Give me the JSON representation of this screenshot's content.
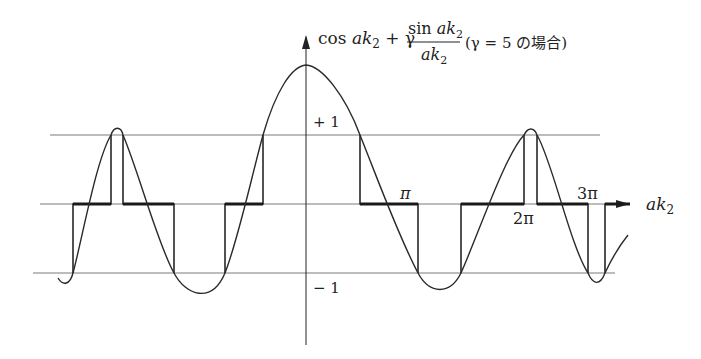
{
  "title": {
    "prefix": "cos ",
    "var": "ak",
    "sub": "2",
    "plus": " + γ ",
    "frac_num_fn": "sin ",
    "frac_num_var": "ak",
    "frac_num_sub": "2",
    "frac_den_var": "ak",
    "frac_den_sub": "2",
    "condition": "(γ = 5 の場合)"
  },
  "axes": {
    "x_label_var": "ak",
    "x_label_sub": "2",
    "y_plus_one": "+ 1",
    "y_minus_one": "− 1"
  },
  "ticks": {
    "pi": "π",
    "two_pi": "2π",
    "three_pi": "3π"
  },
  "colors": {
    "curve": "#2a2a2a",
    "bands": "#1a1a1a",
    "gridlines": "#7a7a7a",
    "axis": "#222222"
  }
}
